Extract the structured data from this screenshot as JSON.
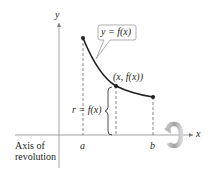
{
  "diagram": {
    "type": "surface-of-revolution",
    "axes": {
      "x_label": "x",
      "y_label": "y"
    },
    "curve": {
      "label": "y = f(x)",
      "color": "#231f20"
    },
    "points": {
      "start": "a",
      "end": "b",
      "sample_point": "(x, f(x))"
    },
    "radius_label": "r = f(x)",
    "axis_of_revolution_label": {
      "line1": "Axis of",
      "line2": "revolution"
    },
    "colors": {
      "ink": "#231f20",
      "dashed": "#555555",
      "callout_border": "#9a9a9a",
      "rotation_arrow": "#a7a9ac"
    }
  }
}
